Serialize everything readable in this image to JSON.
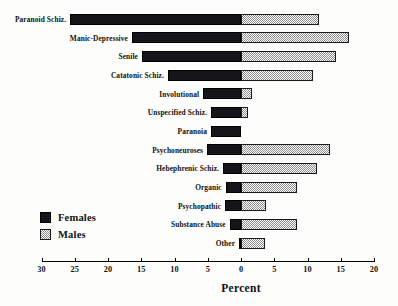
{
  "chart_data": {
    "type": "bar",
    "orientation": "horizontal",
    "style": "diverging-stacked",
    "title": "",
    "xlabel": "Percent",
    "ylabel": "",
    "xlim": [
      -30,
      20
    ],
    "xticks": [
      30,
      25,
      20,
      15,
      10,
      5,
      0,
      5,
      10,
      15,
      20
    ],
    "grid": false,
    "legend": {
      "position": "lower-left",
      "entries": [
        {
          "name": "Females",
          "color": "#16161a",
          "pattern": "solid-black"
        },
        {
          "name": "Males",
          "color": "#8d8d8d",
          "pattern": "gray-checker"
        }
      ]
    },
    "categories": [
      "Paranoid Schiz.",
      "Manic-Depressive",
      "Senile",
      "Catatonic Schiz.",
      "Involutional",
      "Unspecified Schiz.",
      "Paranoia",
      "Psychoneuroses",
      "Hebephrenic Schiz.",
      "Organic",
      "Psychopathic",
      "Substance Abuse",
      "Other"
    ],
    "series": [
      {
        "name": "Females",
        "direction": "left",
        "values": [
          25.7,
          16.4,
          14.9,
          11.0,
          5.7,
          4.5,
          4.5,
          5.1,
          2.7,
          2.3,
          2.4,
          1.7,
          0.3
        ]
      },
      {
        "name": "Males",
        "direction": "right",
        "values": [
          11.7,
          16.2,
          14.3,
          10.8,
          1.7,
          1.1,
          0.0,
          13.4,
          11.4,
          8.4,
          3.7,
          8.4,
          3.6
        ]
      }
    ]
  },
  "axis": {
    "title": "Percent",
    "tick_labels": [
      "30",
      "25",
      "20",
      "15",
      "10",
      "5",
      "0",
      "5",
      "10",
      "15",
      "20"
    ]
  },
  "legend": {
    "females_label": "Females",
    "males_label": "Males"
  }
}
